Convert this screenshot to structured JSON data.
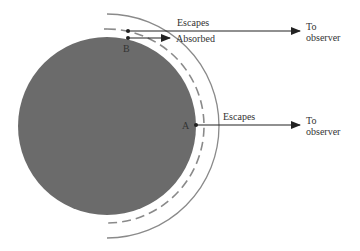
{
  "diagram": {
    "type": "limb-darkening schematic",
    "sphere": {
      "color": "#6b6b6b"
    },
    "line_color": "#8a8a8a",
    "ray_color": "#222222",
    "points": [
      {
        "id": "A",
        "label": "A"
      },
      {
        "id": "B",
        "label": "B"
      }
    ],
    "rays": [
      {
        "from": "B (outer)",
        "label": "Escapes",
        "target_label": [
          "To",
          "observer"
        ]
      },
      {
        "from": "B (inner)",
        "label": "Absorbed"
      },
      {
        "from": "A",
        "label": "Escapes",
        "target_label": [
          "To",
          "observer"
        ]
      }
    ]
  }
}
